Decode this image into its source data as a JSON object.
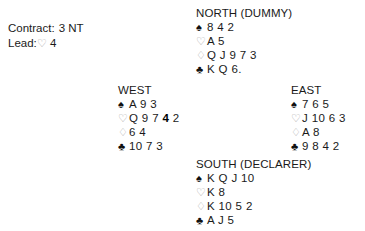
{
  "contract_info": {
    "contract_label": "Contract:",
    "contract_value": "3 NT",
    "lead_label": "Lead:",
    "lead_suit_symbol": "♡",
    "lead_suit_name": "hearts",
    "lead_card": "4"
  },
  "suit_symbols": {
    "spades": "♠",
    "hearts": "♡",
    "diamonds": "♢",
    "clubs": "♣"
  },
  "colors": {
    "background": "#ffffff",
    "text": "#1a1a1a",
    "solid_suit": "#111111",
    "hollow_suit": "#a8a8a8",
    "lead_card_highlight": "#000000"
  },
  "hands": {
    "north": {
      "label": "NORTH (DUMMY)",
      "spades": "8 4 2",
      "hearts": "A 5",
      "diamonds": "Q J 9 7 3",
      "clubs": "K Q 6."
    },
    "west": {
      "label": "WEST",
      "spades": "A 9 3",
      "hearts_pre": "Q 9 7 ",
      "hearts_bold": "4",
      "hearts_post": " 2",
      "diamonds": "6 4",
      "clubs": "10 7 3"
    },
    "east": {
      "label": "EAST",
      "spades": "7 6 5",
      "hearts": "J 10 6 3",
      "diamonds": "A 8",
      "clubs": "9 8 4 2"
    },
    "south": {
      "label": "SOUTH (DECLARER)",
      "spades": "K Q J 10",
      "hearts": "K 8",
      "diamonds": "K 10 5 2",
      "clubs": "A J 5"
    }
  }
}
